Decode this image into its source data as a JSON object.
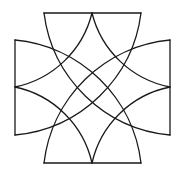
{
  "figure": {
    "stroke_color": "#1a1a1a",
    "background_color": "#ffffff",
    "edges": {
      "top": [
        [
          44,
          13
        ],
        [
          141,
          13
        ]
      ],
      "bottom": [
        [
          44,
          163
        ],
        [
          141,
          163
        ]
      ],
      "left": [
        [
          15,
          40
        ],
        [
          15,
          135
        ]
      ],
      "right": [
        [
          170,
          40
        ],
        [
          170,
          135
        ]
      ]
    },
    "midpoints": {
      "top": [
        92,
        13
      ],
      "bottom": [
        92,
        163
      ],
      "left": [
        15,
        87
      ],
      "right": [
        170,
        87
      ]
    }
  }
}
